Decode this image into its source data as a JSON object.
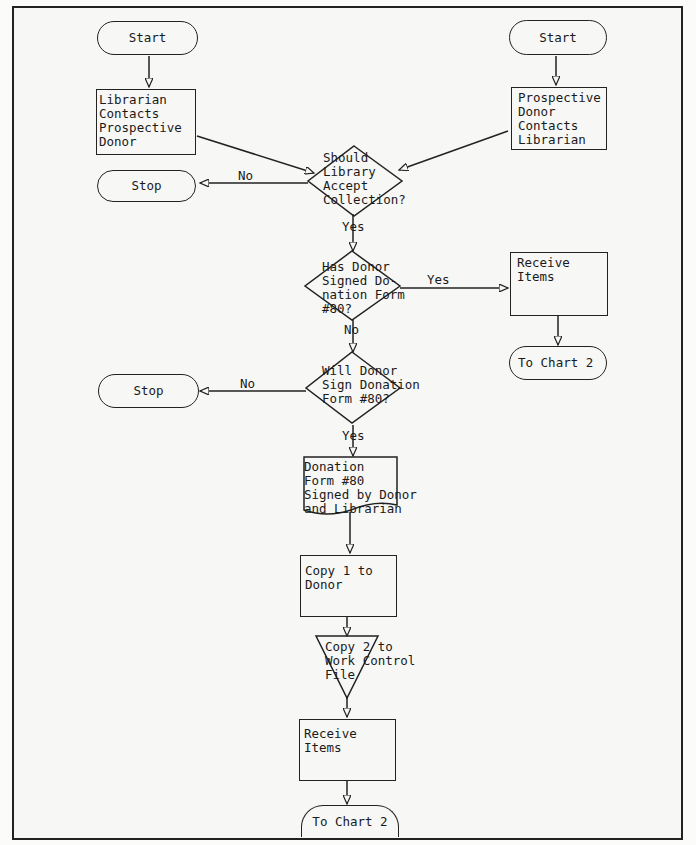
{
  "diagram": {
    "type": "flowchart",
    "nodes": {
      "start_left": {
        "label": "Start"
      },
      "librarian_contacts": {
        "label": "Librarian Contacts Prospective Donor",
        "lines": [
          "Librarian",
          "Contacts",
          "Prospective",
          "Donor"
        ]
      },
      "start_right": {
        "label": "Start"
      },
      "donor_contacts": {
        "label": "Prospective Donor Contacts Librarian",
        "lines": [
          "Prospective",
          "Donor",
          "Contacts",
          "Librarian"
        ]
      },
      "should_accept": {
        "label": "Should Library Accept Collection?",
        "lines": [
          "Should",
          "Library",
          "Accept",
          "Collection?"
        ]
      },
      "stop_1": {
        "label": "Stop"
      },
      "has_signed": {
        "label": "Has Donor Signed Donation Form #80?",
        "lines": [
          "Has Donor",
          "Signed Do-",
          "nation Form",
          "#80?"
        ]
      },
      "receive_items_right": {
        "label": "Receive Items",
        "lines": [
          "Receive",
          "Items"
        ]
      },
      "to_chart2_right": {
        "label": "To Chart 2"
      },
      "will_sign": {
        "label": "Will Donor Sign Donation Form #80?",
        "lines": [
          "Will Donor",
          "Sign Donation",
          "Form #80?"
        ]
      },
      "stop_2": {
        "label": "Stop"
      },
      "form_signed": {
        "label": "Donation Form #80 Signed by Donor and Librarian",
        "lines": [
          "Donation",
          "Form #80",
          "Signed by Donor",
          "and Librarian"
        ]
      },
      "copy1": {
        "label": "Copy 1 to Donor",
        "lines": [
          "Copy 1 to",
          "Donor"
        ]
      },
      "copy2": {
        "label": "Copy 2 to Work Control File",
        "lines": [
          "Copy 2 to",
          "Work Control",
          "File"
        ]
      },
      "receive_items_bottom": {
        "label": "Receive Items",
        "lines": [
          "Receive",
          "Items"
        ]
      },
      "to_chart2_bottom": {
        "label": "To Chart 2"
      }
    },
    "edge_labels": {
      "accept_no": "No",
      "accept_yes": "Yes",
      "signed_yes": "Yes",
      "signed_no": "No",
      "will_no": "No",
      "will_yes": "Yes"
    },
    "edges": [
      [
        "start_left",
        "librarian_contacts"
      ],
      [
        "start_right",
        "donor_contacts"
      ],
      [
        "librarian_contacts",
        "should_accept"
      ],
      [
        "donor_contacts",
        "should_accept"
      ],
      [
        "should_accept",
        "stop_1",
        "No"
      ],
      [
        "should_accept",
        "has_signed",
        "Yes"
      ],
      [
        "has_signed",
        "receive_items_right",
        "Yes"
      ],
      [
        "receive_items_right",
        "to_chart2_right"
      ],
      [
        "has_signed",
        "will_sign",
        "No"
      ],
      [
        "will_sign",
        "stop_2",
        "No"
      ],
      [
        "will_sign",
        "form_signed",
        "Yes"
      ],
      [
        "form_signed",
        "copy1"
      ],
      [
        "copy1",
        "copy2"
      ],
      [
        "copy2",
        "receive_items_bottom"
      ],
      [
        "receive_items_bottom",
        "to_chart2_bottom"
      ]
    ]
  }
}
